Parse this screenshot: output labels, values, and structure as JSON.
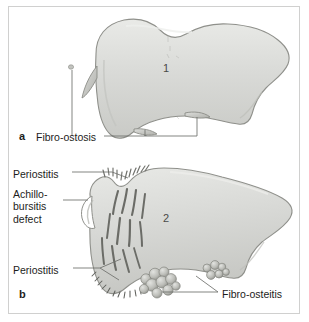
{
  "figure": {
    "kind": "anatomical-illustration",
    "panels": [
      {
        "letter": "a",
        "number_marker": "1",
        "labels": [
          "Fibro-ostosis"
        ]
      },
      {
        "letter": "b",
        "number_marker": "2",
        "labels": [
          "Periostitis",
          "Achillo-\nbursitis\ndefect",
          "Periostitis",
          "Fibro-osteitis"
        ]
      }
    ]
  },
  "panel_a": {
    "letter": "a",
    "number": "1",
    "label_fibro_ostosis": "Fibro-ostosis"
  },
  "panel_b": {
    "letter": "b",
    "number": "2",
    "label_periostitis_top": "Periostitis",
    "label_achillo_bursitis_defect": "Achillo-\nbursitis\ndefect",
    "label_periostitis_bottom": "Periostitis",
    "label_fibro_osteitis": "Fibro-osteitis"
  },
  "colors": {
    "bone_fill": "#d6d7d4",
    "bone_fill_light": "#e6e7e4",
    "bone_outline": "#8c8d88",
    "frame_border": "#d0d0cf",
    "text": "#1d1d1b",
    "leader_line": "#6e6f6b",
    "marking": "#6b6c67",
    "background": "#ffffff"
  }
}
